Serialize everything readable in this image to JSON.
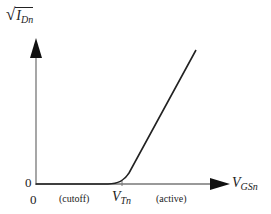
{
  "diagram": {
    "y_axis": {
      "label_main": "I",
      "label_sub": "Dn",
      "label_prefix": "√",
      "origin_label": "0"
    },
    "x_axis": {
      "label_main": "V",
      "label_sub": "GSn",
      "origin_label": "0"
    },
    "threshold": {
      "label_main": "V",
      "label_sub": "Tn"
    },
    "regions": {
      "cutoff": "(cutoff)",
      "active": "(active)"
    },
    "colors": {
      "axis": "#777777",
      "curve": "#222222",
      "arrowhead": "#111111"
    }
  }
}
